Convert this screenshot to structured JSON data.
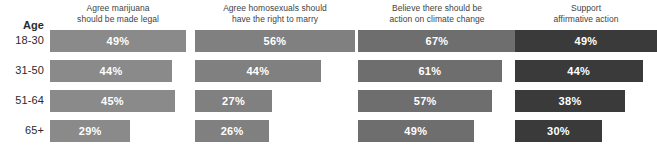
{
  "chart_data": {
    "type": "bar",
    "title": "",
    "subtitle": "",
    "xlabel": "",
    "ylabel": "Age",
    "orientation": "horizontal",
    "grouping": "grouped-by-question",
    "grid": false,
    "legend": "none",
    "xlim": [
      0,
      100
    ],
    "value_suffix": "%",
    "categories": [
      "18-30",
      "31-50",
      "51-64",
      "65+"
    ],
    "category_axis_title": "Age",
    "series": [
      {
        "name": "Agree marijuana should be made legal",
        "label_line1": "Agree marijuana",
        "label_line2": "should be made legal",
        "color": "#8a8a8a",
        "values": [
          49,
          44,
          45,
          29
        ],
        "value_labels": [
          "49%",
          "44%",
          "45%",
          "29%"
        ]
      },
      {
        "name": "Agree homosexuals should have the right to marry",
        "label_line1": "Agree homosexuals should",
        "label_line2": "have the right to marry",
        "color": "#808080",
        "values": [
          56,
          44,
          27,
          26
        ],
        "value_labels": [
          "56%",
          "44%",
          "27%",
          "26%"
        ]
      },
      {
        "name": "Believe there should be action on climate change",
        "label_line1": "Believe there should be",
        "label_line2": "action on climate change",
        "color": "#6e6e6e",
        "values": [
          67,
          61,
          57,
          49
        ],
        "value_labels": [
          "67%",
          "61%",
          "57%",
          "49%"
        ]
      },
      {
        "name": "Support affirmative action",
        "label_line1": "Support",
        "label_line2": "affirmative action",
        "color": "#3a3a3a",
        "values": [
          49,
          44,
          38,
          30
        ],
        "value_labels": [
          "49%",
          "44%",
          "38%",
          "30%"
        ]
      }
    ]
  },
  "colors": {
    "background": "#ffffff",
    "header_text": "#3f3f3f",
    "axis_text": "#2b2b2b",
    "value_text": "#ffffff",
    "series_1": "#8a8a8a",
    "series_2": "#808080",
    "series_3": "#6e6e6e",
    "series_4": "#3a3a3a"
  }
}
